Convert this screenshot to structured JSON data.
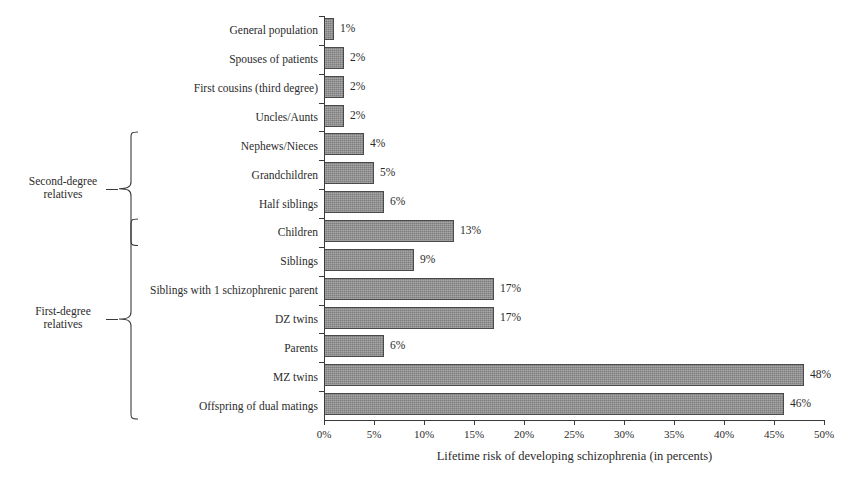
{
  "chart_data": {
    "type": "bar",
    "orientation": "horizontal",
    "title": "",
    "xlabel": "Lifetime risk of developing schizophrenia (in percents)",
    "ylabel": "",
    "xlim": [
      0,
      50
    ],
    "grid": false,
    "legend": false,
    "tick_labels": [
      "0%",
      "5%",
      "10%",
      "15%",
      "20%",
      "25%",
      "30%",
      "35%",
      "40%",
      "45%",
      "50%"
    ],
    "tick_values": [
      0,
      5,
      10,
      15,
      20,
      25,
      30,
      35,
      40,
      45,
      50
    ],
    "categories": [
      "General population",
      "Spouses of patients",
      "First cousins (third degree)",
      "Uncles/Aunts",
      "Nephews/Nieces",
      "Grandchildren",
      "Half siblings",
      "Children",
      "Siblings",
      "Siblings with 1 schizophrenic parent",
      "DZ twins",
      "Parents",
      "MZ twins",
      "Offspring of dual matings"
    ],
    "values": [
      1,
      2,
      2,
      2,
      4,
      5,
      6,
      13,
      9,
      17,
      17,
      6,
      48,
      46
    ],
    "value_labels": [
      "1%",
      "2%",
      "2%",
      "2%",
      "4%",
      "5%",
      "6%",
      "13%",
      "9%",
      "17%",
      "17%",
      "6%",
      "48%",
      "46%"
    ],
    "bar_color": "#8d8d8d",
    "bar_edge_color": "#4a4a4a",
    "groups": [
      {
        "label": "Second-degree\nrelatives",
        "label_line1": "Second-degree",
        "label_line2": "relatives",
        "first_index": 4,
        "last_index": 7
      },
      {
        "label": "First-degree\nrelatives",
        "label_line1": "First-degree",
        "label_line2": "relatives",
        "first_index": 7,
        "last_index": 13
      }
    ]
  }
}
